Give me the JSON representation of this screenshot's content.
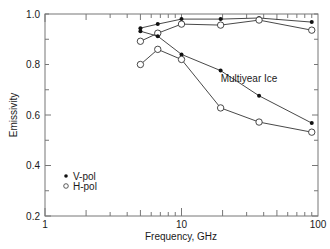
{
  "chart_data": {
    "type": "line",
    "title": "",
    "annotation": "Multiyear Ice",
    "xlabel": "Frequency, GHz",
    "ylabel": "Emissivity",
    "xscale": "log",
    "xlim": [
      1,
      100
    ],
    "ylim": [
      0.2,
      1.0
    ],
    "xticks_labeled": [
      1,
      10,
      100
    ],
    "xtick_labels": [
      "1",
      "10",
      "100"
    ],
    "yticks": [
      0.2,
      0.4,
      0.6,
      0.8,
      1.0
    ],
    "ytick_labels": [
      "0.2",
      "0.4",
      "0.6",
      "0.8",
      "1.0"
    ],
    "grid": false,
    "legend_position": "lower-left",
    "legend": [
      {
        "label": "V-pol",
        "marker": "filled-dot"
      },
      {
        "label": "H-pol",
        "marker": "open-circle"
      }
    ],
    "x": [
      5,
      6.7,
      10,
      19.35,
      37,
      90
    ],
    "series": [
      {
        "name": "V-pol (upper)",
        "marker": "filled-dot",
        "values": [
          0.944,
          0.96,
          0.98,
          0.98,
          0.984,
          0.968
        ]
      },
      {
        "name": "H-pol (upper)",
        "marker": "open-circle",
        "values": [
          0.892,
          0.924,
          0.96,
          0.956,
          0.976,
          0.936
        ]
      },
      {
        "name": "V-pol (lower)",
        "marker": "filled-dot",
        "values": [
          0.932,
          0.912,
          0.84,
          0.776,
          0.676,
          0.568
        ]
      },
      {
        "name": "H-pol (lower)",
        "marker": "open-circle",
        "values": [
          0.8,
          0.86,
          0.82,
          0.628,
          0.572,
          0.532
        ]
      }
    ]
  },
  "colors": {
    "axis": "#777777",
    "line": "#333333",
    "text": "#1a1a1a",
    "background": "#ffffff"
  }
}
